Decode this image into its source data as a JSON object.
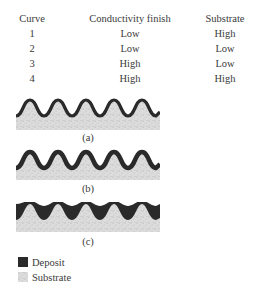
{
  "table": {
    "headers": [
      "Curve",
      "Conductivity finish",
      "Substrate"
    ],
    "rows": [
      [
        "1",
        "Low",
        "High"
      ],
      [
        "2",
        "Low",
        "Low"
      ],
      [
        "3",
        "High",
        "Low"
      ],
      [
        "4",
        "High",
        "High"
      ]
    ]
  },
  "figures": [
    {
      "caption": "(a)",
      "description": "uniform deposit layer over wavy substrate"
    },
    {
      "caption": "(b)",
      "description": "thicker deposit at peaks"
    },
    {
      "caption": "(c)",
      "description": "deposit filling valleys (leveling)"
    }
  ],
  "legend": {
    "items": [
      {
        "label": "Deposit",
        "color": "#2a2a2a"
      },
      {
        "label": "Substrate",
        "color": "#d4d4d4"
      }
    ]
  },
  "colors": {
    "deposit": "#2a2a2a",
    "substrate": "#d6d6d6",
    "text": "#3a3a3a"
  }
}
